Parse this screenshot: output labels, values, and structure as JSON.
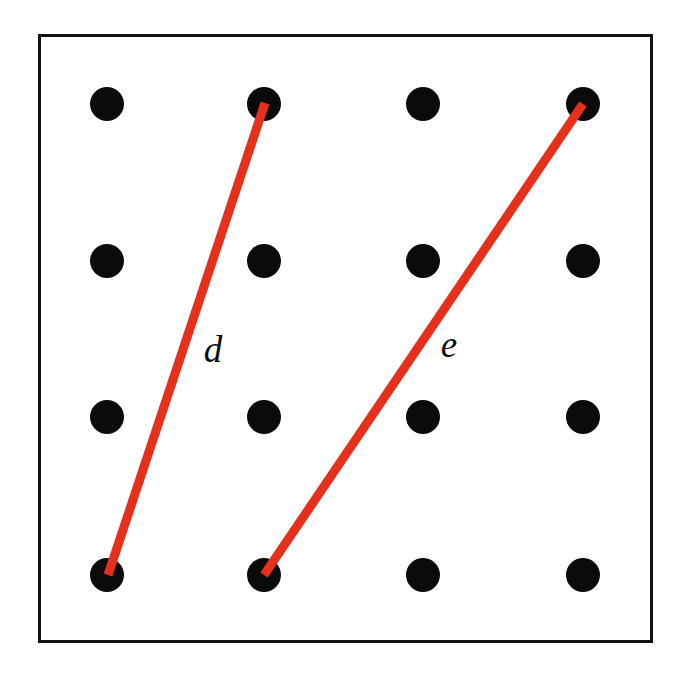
{
  "figure": {
    "background_color": "#ffffff",
    "frame": {
      "x": 38,
      "y": 34,
      "width": 615,
      "height": 609,
      "stroke_color": "#111111",
      "stroke_width": 3
    }
  },
  "chart_data": {
    "type": "scatter",
    "title": "",
    "xlabel": "",
    "ylabel": "",
    "grid": false,
    "legend": null,
    "xlim": [
      38,
      653
    ],
    "ylim": [
      34,
      643
    ],
    "point_style": {
      "color": "#0b0b0b",
      "radius": 17,
      "shape": "circle"
    },
    "columns_x": [
      107,
      264,
      423,
      583
    ],
    "rows_y": [
      104,
      261,
      417,
      575
    ],
    "points": [
      {
        "id": "r1c1",
        "x": 107,
        "y": 104
      },
      {
        "id": "r1c2",
        "x": 264,
        "y": 104
      },
      {
        "id": "r1c3",
        "x": 423,
        "y": 104
      },
      {
        "id": "r1c4",
        "x": 583,
        "y": 104
      },
      {
        "id": "r2c1",
        "x": 107,
        "y": 261
      },
      {
        "id": "r2c2",
        "x": 264,
        "y": 261
      },
      {
        "id": "r2c3",
        "x": 423,
        "y": 261
      },
      {
        "id": "r2c4",
        "x": 583,
        "y": 261
      },
      {
        "id": "r3c1",
        "x": 107,
        "y": 417
      },
      {
        "id": "r3c2",
        "x": 264,
        "y": 417
      },
      {
        "id": "r3c3",
        "x": 423,
        "y": 417
      },
      {
        "id": "r3c4",
        "x": 583,
        "y": 417
      },
      {
        "id": "r4c1",
        "x": 107,
        "y": 575
      },
      {
        "id": "r4c2",
        "x": 264,
        "y": 575
      },
      {
        "id": "r4c3",
        "x": 423,
        "y": 575
      },
      {
        "id": "r4c4",
        "x": 583,
        "y": 575
      }
    ],
    "segments": [
      {
        "name": "d",
        "label": "d",
        "color": "#E5301B",
        "stroke_width": 9,
        "x1": 265,
        "y1": 103,
        "x2": 108,
        "y2": 575,
        "from_point": "r1c2",
        "to_point": "r4c1",
        "label_x": 213,
        "label_y": 349
      },
      {
        "name": "e",
        "label": "e",
        "color": "#E5301B",
        "stroke_width": 9,
        "x1": 264,
        "y1": 575,
        "x2": 583,
        "y2": 104,
        "from_point": "r4c2",
        "to_point": "r1c4",
        "label_x": 449,
        "label_y": 344
      }
    ]
  }
}
